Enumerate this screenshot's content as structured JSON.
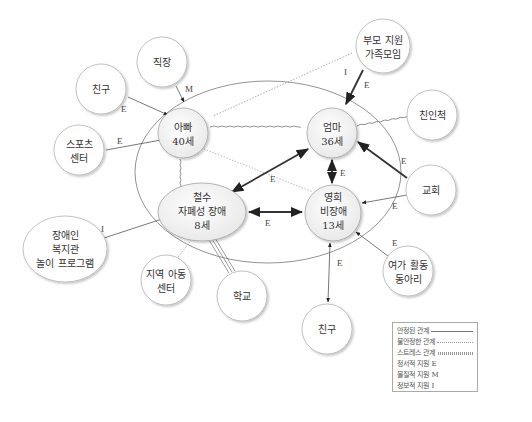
{
  "diagram": {
    "type": "ecomap",
    "household": {
      "members": [
        {
          "id": "dad",
          "lines": [
            "아빠",
            "40세"
          ]
        },
        {
          "id": "mom",
          "lines": [
            "엄마",
            "36세"
          ]
        },
        {
          "id": "chulsoo",
          "lines": [
            "철수",
            "자폐성 장애",
            "8세"
          ]
        },
        {
          "id": "younghee",
          "lines": [
            "영희",
            "비장애",
            "13세"
          ]
        }
      ]
    },
    "external": [
      {
        "id": "work",
        "lines": [
          "직장"
        ]
      },
      {
        "id": "friend_dad",
        "lines": [
          "친구"
        ]
      },
      {
        "id": "sports",
        "lines": [
          "스포츠",
          "센터"
        ]
      },
      {
        "id": "parent_support",
        "lines": [
          "부모 지원",
          "가족모임"
        ]
      },
      {
        "id": "relatives",
        "lines": [
          "친인척"
        ]
      },
      {
        "id": "church",
        "lines": [
          "교회"
        ]
      },
      {
        "id": "welfare",
        "lines": [
          "장애인",
          "복지관",
          "놀이 프로그램"
        ]
      },
      {
        "id": "community_center",
        "lines": [
          "지역 아동",
          "센터"
        ]
      },
      {
        "id": "school",
        "lines": [
          "학교"
        ]
      },
      {
        "id": "friend_yh",
        "lines": [
          "친구"
        ]
      },
      {
        "id": "leisure",
        "lines": [
          "여가 활동",
          "동아리"
        ]
      }
    ],
    "edges": [
      {
        "from": "work",
        "to": "dad",
        "style": "solid",
        "arrow": "to",
        "label": "M"
      },
      {
        "from": "friend_dad",
        "to": "dad",
        "style": "solid",
        "arrow": "to",
        "label": "E"
      },
      {
        "from": "sports",
        "to": "dad",
        "style": "solid",
        "arrow": "to",
        "label": "E"
      },
      {
        "from": "parent_support",
        "to": "mom",
        "style": "solid-bold",
        "arrow": "to",
        "label": "E"
      },
      {
        "from": "parent_support",
        "to": "dad",
        "style": "dotted",
        "arrow": "none",
        "label": "I"
      },
      {
        "from": "relatives",
        "to": "mom",
        "style": "wavy",
        "arrow": "none",
        "label": ""
      },
      {
        "from": "church",
        "to": "mom",
        "style": "solid-bold",
        "arrow": "to",
        "label": "E"
      },
      {
        "from": "church",
        "to": "younghee",
        "style": "solid",
        "arrow": "to",
        "label": "E"
      },
      {
        "from": "leisure",
        "to": "younghee",
        "style": "solid",
        "arrow": "to",
        "label": "E"
      },
      {
        "from": "welfare",
        "to": "chulsoo",
        "style": "solid",
        "arrow": "to",
        "label": "I"
      },
      {
        "from": "community_center",
        "to": "chulsoo",
        "style": "dotted",
        "arrow": "none",
        "label": ""
      },
      {
        "from": "school",
        "to": "chulsoo",
        "style": "triple",
        "arrow": "none",
        "label": ""
      },
      {
        "from": "younghee",
        "to": "friend_yh",
        "style": "solid",
        "arrow": "both",
        "label": "E"
      },
      {
        "from": "dad",
        "to": "mom",
        "style": "wavy",
        "arrow": "none",
        "label": ""
      },
      {
        "from": "dad",
        "to": "younghee",
        "style": "dotted",
        "arrow": "none",
        "label": ""
      },
      {
        "from": "dad",
        "to": "chulsoo",
        "style": "wavy",
        "arrow": "none",
        "label": ""
      },
      {
        "from": "mom",
        "to": "chulsoo",
        "style": "solid-bold",
        "arrow": "both",
        "label": "E"
      },
      {
        "from": "mom",
        "to": "younghee",
        "style": "solid-bold",
        "arrow": "both",
        "label": "E"
      },
      {
        "from": "chulsoo",
        "to": "younghee",
        "style": "solid-bold",
        "arrow": "both",
        "label": "E"
      }
    ]
  },
  "legend": {
    "items": [
      {
        "label": "안정된 관계",
        "style": "solid"
      },
      {
        "label": "불안정한 관계",
        "style": "dotted"
      },
      {
        "label": "스트레스 관계",
        "style": "wavy"
      },
      {
        "label": "정서적 지원 E",
        "style": "text"
      },
      {
        "label": "물질적 지원 M",
        "style": "text"
      },
      {
        "label": "정보적 지원 I",
        "style": "text"
      }
    ]
  },
  "labels": {
    "dad": [
      "아빠",
      "40세"
    ],
    "mom": [
      "엄마",
      "36세"
    ],
    "chulsoo": [
      "철수",
      "자폐성 장애",
      "8세"
    ],
    "younghee": [
      "영희",
      "비장애",
      "13세"
    ],
    "work": "직장",
    "friend_dad": "친구",
    "sports": [
      "스포츠",
      "센터"
    ],
    "parent_support": [
      "부모 지원",
      "가족모임"
    ],
    "relatives": "친인척",
    "church": "교회",
    "welfare": [
      "장애인",
      "복지관",
      "놀이 프로그램"
    ],
    "community_center": [
      "지역 아동",
      "센터"
    ],
    "school": "학교",
    "friend_yh": "친구",
    "leisure": [
      "여가 활동",
      "동아리"
    ],
    "edge": {
      "E": "E",
      "M": "M",
      "I": "I"
    }
  }
}
